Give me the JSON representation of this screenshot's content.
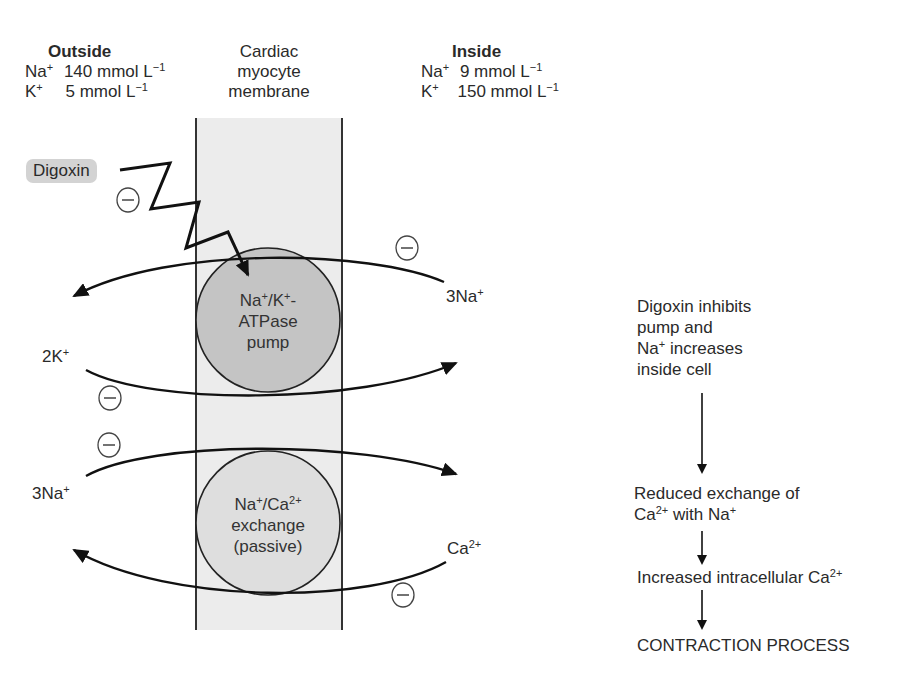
{
  "outside": {
    "heading": "Outside",
    "ions": [
      {
        "ion": "Na",
        "charge": "+",
        "value": "140 mmol L",
        "exp": "−1"
      },
      {
        "ion": "K",
        "charge": "+",
        "value": "5 mmol L",
        "exp": "−1"
      }
    ]
  },
  "membrane": {
    "line1": "Cardiac",
    "line2": "myocyte",
    "line3": "membrane"
  },
  "inside": {
    "heading": "Inside",
    "ions": [
      {
        "ion": "Na",
        "charge": "+",
        "value": "9 mmol L",
        "exp": "−1"
      },
      {
        "ion": "K",
        "charge": "+",
        "value": "150 mmol L",
        "exp": "−1"
      }
    ]
  },
  "drug": {
    "label": "Digoxin",
    "inhibit_symbol": "−"
  },
  "pump": {
    "line1_a": "Na",
    "line1_a_sup": "+",
    "line1_b": "/K",
    "line1_b_sup": "+",
    "line1_c": "-",
    "line2": "ATPase",
    "line3": "pump"
  },
  "exchanger": {
    "line1_a": "Na",
    "line1_a_sup": "+",
    "line1_b": "/Ca",
    "line1_b_sup": "2+",
    "line2": "exchange",
    "line3": "(passive)"
  },
  "flux_labels": {
    "pump_na_out": {
      "text": "3Na",
      "sup": "+"
    },
    "pump_k_in": {
      "text": "2K",
      "sup": "+"
    },
    "exch_na_in": {
      "text": "3Na",
      "sup": "+"
    },
    "exch_ca_out": {
      "text": "Ca",
      "sup": "2+"
    }
  },
  "flow": {
    "step1": [
      "Digoxin inhibits",
      "pump and",
      {
        "a": "Na",
        "sup": "+",
        "b": " increases"
      },
      "inside cell"
    ],
    "step2": [
      "Reduced exchange of",
      {
        "a": "Ca",
        "sup": "2+",
        "b": " with Na",
        "sup2": "+"
      }
    ],
    "step3": {
      "a": "Increased intracellular Ca",
      "sup": "2+"
    },
    "step4": "CONTRACTION PROCESS"
  },
  "colors": {
    "membrane_fill": "#ececec",
    "pump_fill": "#c4c4c4",
    "exchanger_fill": "#dedede",
    "badge_fill": "#d3d3d3",
    "stroke": "#1a1a1a"
  }
}
